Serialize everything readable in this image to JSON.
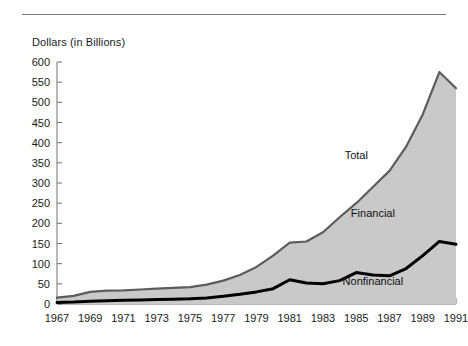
{
  "chart_data": {
    "type": "area",
    "title": "",
    "ylabel": "Dollars (in Billions)",
    "xlabel": "",
    "ylim": [
      0,
      600
    ],
    "ytick_step": 50,
    "yticks": [
      "0",
      "50",
      "100",
      "150",
      "200",
      "250",
      "300",
      "350",
      "400",
      "450",
      "500",
      "550",
      "600"
    ],
    "grid": false,
    "legend_position": "inline-annotations",
    "x": [
      1967,
      1968,
      1969,
      1970,
      1971,
      1972,
      1973,
      1974,
      1975,
      1976,
      1977,
      1978,
      1979,
      1980,
      1981,
      1982,
      1983,
      1984,
      1985,
      1986,
      1987,
      1988,
      1989,
      1990,
      1991
    ],
    "xtick_labels": [
      "1967",
      "1969",
      "1971",
      "1973",
      "1975",
      "1977",
      "1979",
      "1981",
      "1983",
      "1985",
      "1987",
      "1989",
      "1991"
    ],
    "xtick_label_step_years": 2,
    "minor_ticks_every_year": true,
    "series": [
      {
        "name": "Total",
        "style": "area-upper-boundary",
        "values": [
          16,
          20,
          30,
          33,
          34,
          36,
          38,
          40,
          42,
          48,
          58,
          72,
          92,
          120,
          152,
          155,
          178,
          215,
          250,
          290,
          330,
          390,
          470,
          575,
          535
        ]
      },
      {
        "name": "Nonfinancial",
        "style": "thick-black-line",
        "values": [
          4,
          5,
          7,
          8,
          9,
          10,
          11,
          12,
          13,
          15,
          19,
          24,
          30,
          38,
          60,
          52,
          50,
          58,
          78,
          72,
          70,
          88,
          120,
          155,
          148
        ]
      },
      {
        "name": "Financial",
        "style": "shaded-region-between",
        "values": [
          12,
          15,
          23,
          25,
          25,
          26,
          27,
          28,
          29,
          33,
          39,
          48,
          62,
          82,
          92,
          103,
          128,
          157,
          172,
          218,
          260,
          302,
          350,
          420,
          387
        ]
      }
    ],
    "annotations": [
      {
        "text": "Total",
        "x_year": 1985,
        "y_value": 360
      },
      {
        "text": "Financial",
        "x_year": 1986,
        "y_value": 215
      },
      {
        "text": "Nonfinancial",
        "x_year": 1986,
        "y_value": 48
      }
    ],
    "colors": {
      "area_fill": "#c9c9c9",
      "area_outline": "#5c5c5c",
      "nonfinancial_line": "#000000",
      "axis": "#6e6e6e",
      "text": "#1a1a1a",
      "background": "#ffffff"
    }
  }
}
